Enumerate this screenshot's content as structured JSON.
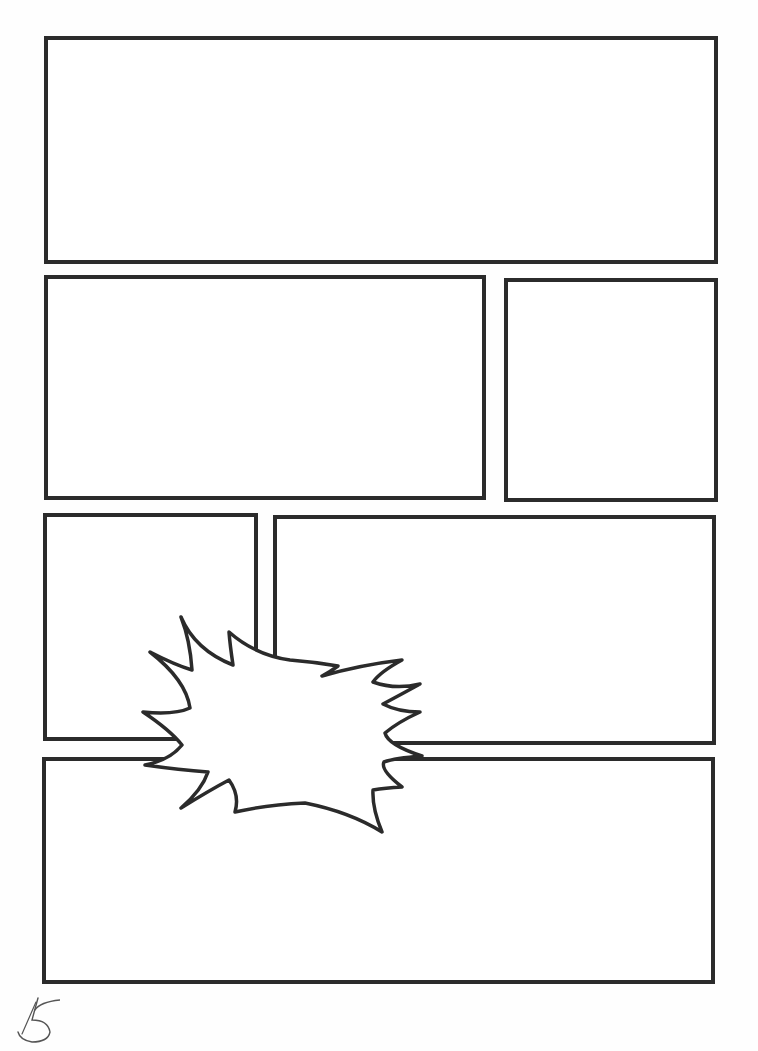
{
  "page": {
    "page_number": "5",
    "line_color": "#2b2b2b",
    "background": "#ffffff"
  },
  "panels": [
    {
      "id": "panel-1",
      "label": "Panel 1",
      "x": 44,
      "y": 36,
      "w": 674,
      "h": 228
    },
    {
      "id": "panel-2",
      "label": "Panel 2",
      "x": 44,
      "y": 275,
      "w": 442,
      "h": 225
    },
    {
      "id": "panel-3",
      "label": "Panel 3",
      "x": 504,
      "y": 278,
      "w": 214,
      "h": 224
    },
    {
      "id": "panel-4",
      "label": "Panel 4",
      "x": 43,
      "y": 513,
      "w": 215,
      "h": 228
    },
    {
      "id": "panel-5",
      "label": "Panel 5",
      "x": 273,
      "y": 515,
      "w": 443,
      "h": 230
    },
    {
      "id": "panel-6",
      "label": "Panel 6",
      "x": 42,
      "y": 757,
      "w": 673,
      "h": 227
    }
  ],
  "burst": {
    "label": "Explosion burst balloon (empty)",
    "text": ""
  }
}
